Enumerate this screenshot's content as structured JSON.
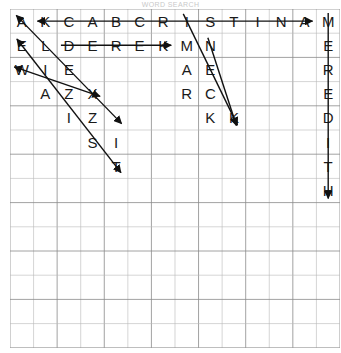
{
  "page": {
    "header_faint_text": "WORD SEARCH",
    "background_color": "#ffffff",
    "grid_line_color": "#b8b8b8",
    "grid_major_line_color": "#8a8a8a",
    "letter_color": "#1a1a1a",
    "strike_color": "#111111"
  },
  "grid": {
    "columns": 14,
    "rows": 14,
    "cell_width": 23.57,
    "cell_height": 24.2,
    "origin_x": 10,
    "origin_y": 9,
    "letters": [
      [
        "A",
        "K",
        "C",
        "A",
        "B",
        "C",
        "R",
        "I",
        "S",
        "T",
        "I",
        "N",
        "A",
        "M"
      ],
      [
        "E",
        "L",
        "D",
        "E",
        "R",
        "E",
        "K",
        "M",
        "N",
        "",
        "",
        "",
        "",
        "E"
      ],
      [
        "W",
        "I",
        "E",
        "",
        "",
        "",
        "",
        "A",
        "E",
        "",
        "",
        "",
        "",
        "R"
      ],
      [
        "",
        "A",
        "Z",
        "X",
        "",
        "",
        "",
        "R",
        "C",
        "",
        "",
        "",
        "",
        "E"
      ],
      [
        "",
        "",
        "I",
        "Z",
        "",
        "",
        "",
        "",
        "K",
        "K",
        "",
        "",
        "",
        "D"
      ],
      [
        "",
        "",
        "",
        "S",
        "I",
        "",
        "",
        "",
        "",
        "",
        "",
        "",
        "",
        "I"
      ],
      [
        "",
        "",
        "",
        "",
        "T",
        "",
        "",
        "",
        "",
        "",
        "",
        "",
        "",
        "T"
      ],
      [
        "",
        "",
        "",
        "",
        "",
        "",
        "",
        "",
        "",
        "",
        "",
        "",
        "",
        "H"
      ],
      [
        "",
        "",
        "",
        "",
        "",
        "",
        "",
        "",
        "",
        "",
        "",
        "",
        "",
        ""
      ],
      [
        "",
        "",
        "",
        "",
        "",
        "",
        "",
        "",
        "",
        "",
        "",
        "",
        "",
        ""
      ],
      [
        "",
        "",
        "",
        "",
        "",
        "",
        "",
        "",
        "",
        "",
        "",
        "",
        "",
        ""
      ],
      [
        "",
        "",
        "",
        "",
        "",
        "",
        "",
        "",
        "",
        "",
        "",
        "",
        "",
        ""
      ],
      [
        "",
        "",
        "",
        "",
        "",
        "",
        "",
        "",
        "",
        "",
        "",
        "",
        "",
        ""
      ],
      [
        "",
        "",
        "",
        "",
        "",
        "",
        "",
        "",
        "",
        "",
        "",
        "",
        "",
        ""
      ]
    ]
  },
  "found_words": [
    {
      "name": "cristina",
      "text": "KCABCRISTINA",
      "direction": "horizontal",
      "start_col": 1,
      "start_row": 0,
      "end_col": 12,
      "end_row": 0,
      "arrow_start": true,
      "arrow_end": true
    },
    {
      "name": "derek",
      "text": "DEREK",
      "direction": "horizontal",
      "start_col": 2,
      "start_row": 1,
      "end_col": 6,
      "end_row": 1,
      "arrow_start": false,
      "arrow_end": true
    },
    {
      "name": "meredith",
      "text": "MEREDITH",
      "direction": "vertical",
      "start_col": 13,
      "start_row": 0,
      "end_col": 13,
      "end_row": 7,
      "arrow_start": false,
      "arrow_end": true
    },
    {
      "name": "elis",
      "text": "AEIZI",
      "direction": "diagonal-down-right",
      "start_col": 0,
      "start_row": 0,
      "end_col": 4,
      "end_row": 4,
      "arrow_start": true,
      "arrow_end": true
    },
    {
      "name": "elizst",
      "text": "ELZST",
      "direction": "diagonal-down-right",
      "start_col": 0,
      "start_row": 1,
      "end_col": 4,
      "end_row": 6,
      "arrow_start": true,
      "arrow_end": true
    },
    {
      "name": "wiex",
      "text": "WIEX",
      "direction": "diagonal-down-right",
      "start_col": 0,
      "start_row": 2,
      "end_col": 3,
      "end_row": 3,
      "arrow_start": true,
      "arrow_end": true
    },
    {
      "name": "mark",
      "text": "MARK",
      "direction": "diagonal-down-right",
      "start_col": 7,
      "start_row": 0,
      "end_col": 9,
      "end_row": 4,
      "arrow_start": false,
      "arrow_end": true
    },
    {
      "name": "neck",
      "text": "NECK",
      "direction": "diagonal-down-right",
      "start_col": 8,
      "start_row": 1,
      "end_col": 9,
      "end_row": 4,
      "arrow_start": false,
      "arrow_end": true
    }
  ]
}
